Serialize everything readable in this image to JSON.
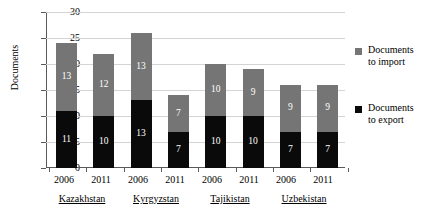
{
  "chart_data": {
    "type": "bar",
    "subtype": "stacked-vertical",
    "title": "",
    "xlabel": "",
    "ylabel": "Documents",
    "ylim": [
      0,
      30
    ],
    "yticks": [
      0,
      5,
      10,
      15,
      20,
      25,
      30
    ],
    "grid": true,
    "legend_position": "right",
    "categories": [
      "2006",
      "2011",
      "2006",
      "2011",
      "2006",
      "2011",
      "2006",
      "2011"
    ],
    "groups": [
      {
        "name": "Kazakhstan",
        "years": [
          "2006",
          "2011"
        ]
      },
      {
        "name": "Kyrgyzstan",
        "years": [
          "2006",
          "2011"
        ]
      },
      {
        "name": "Tajikistan",
        "years": [
          "2006",
          "2011"
        ]
      },
      {
        "name": "Uzbekistan",
        "years": [
          "2006",
          "2011"
        ]
      }
    ],
    "series": [
      {
        "name": "Documents to export",
        "color": "#0a0a0a",
        "values": [
          11,
          10,
          13,
          7,
          10,
          10,
          7,
          7
        ]
      },
      {
        "name": "Documents to import",
        "color": "#757575",
        "values": [
          13,
          12,
          13,
          7,
          10,
          9,
          9,
          9
        ]
      }
    ],
    "totals": [
      24,
      22,
      26,
      14,
      20,
      19,
      16,
      16
    ],
    "bars": [
      {
        "country": "Kazakhstan",
        "year": "2006",
        "export": 11,
        "import": 13,
        "total": 24
      },
      {
        "country": "Kazakhstan",
        "year": "2011",
        "export": 10,
        "import": 12,
        "total": 22
      },
      {
        "country": "Kyrgyzstan",
        "year": "2006",
        "export": 13,
        "import": 13,
        "total": 26
      },
      {
        "country": "Kyrgyzstan",
        "year": "2011",
        "export": 7,
        "import": 7,
        "total": 14
      },
      {
        "country": "Tajikistan",
        "year": "2006",
        "export": 10,
        "import": 10,
        "total": 20
      },
      {
        "country": "Tajikistan",
        "year": "2011",
        "export": 10,
        "import": 9,
        "total": 19
      },
      {
        "country": "Uzbekistan",
        "year": "2006",
        "export": 7,
        "import": 9,
        "total": 16
      },
      {
        "country": "Uzbekistan",
        "year": "2011",
        "export": 7,
        "import": 9,
        "total": 16
      }
    ]
  },
  "axis": {
    "y_title": "Documents",
    "y_tick_labels": [
      "30",
      "25",
      "20",
      "15",
      "10",
      "5",
      "0"
    ],
    "x_year_labels": [
      "2006",
      "2011",
      "2006",
      "2011",
      "2006",
      "2011",
      "2006",
      "2011"
    ],
    "x_country_labels": [
      "Kazakhstan",
      "Kyrgyzstan",
      "Tajikistan",
      "Uzbekistan"
    ]
  },
  "bar_value_labels": {
    "import": [
      "13",
      "12",
      "13",
      "7",
      "10",
      "9",
      "9",
      "9"
    ],
    "export": [
      "11",
      "10",
      "13",
      "7",
      "10",
      "10",
      "7",
      "7"
    ]
  },
  "legend": {
    "items": [
      {
        "label_line1": "Documents",
        "label_line2": "to import",
        "color": "#757575",
        "swatch": "square-gray"
      },
      {
        "label_line1": "Documents",
        "label_line2": "to export",
        "color": "#0a0a0a",
        "swatch": "square-black"
      }
    ]
  },
  "colors": {
    "import": "#757575",
    "export": "#0a0a0a",
    "gridline": "#d4d4d4",
    "axis": "#595959",
    "background": "#ffffff",
    "value_label": "#ffffff"
  }
}
